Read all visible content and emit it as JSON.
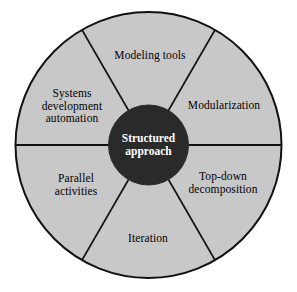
{
  "diagram": {
    "hub": {
      "label": "Structured\napproach",
      "fill": "#2a2a2a",
      "text_color": "#ffffff",
      "radius": 40
    },
    "wheel": {
      "fill": "#c8c8c8",
      "stroke": "#111111",
      "center_x": 148.5,
      "center_y": 145,
      "radius": 133
    },
    "segments": [
      {
        "id": "modeling-tools",
        "label": "Modeling tools",
        "start_angle": -120,
        "end_angle": -60,
        "label_x": 150,
        "label_y": 55
      },
      {
        "id": "modularization",
        "label": "Modularization",
        "start_angle": -60,
        "end_angle": 0,
        "label_x": 224,
        "label_y": 105
      },
      {
        "id": "top-down-decomposition",
        "label": "Top-down\ndecomposition",
        "start_angle": 0,
        "end_angle": 60,
        "label_x": 223,
        "label_y": 183
      },
      {
        "id": "iteration",
        "label": "Iteration",
        "start_angle": 60,
        "end_angle": 120,
        "label_x": 148,
        "label_y": 238
      },
      {
        "id": "parallel-activities",
        "label": "Parallel\nactivities",
        "start_angle": 120,
        "end_angle": 180,
        "label_x": 76,
        "label_y": 185
      },
      {
        "id": "systems-development-automation",
        "label": "Systems\ndevelopment\nautomation",
        "start_angle": 180,
        "end_angle": 240,
        "label_x": 72,
        "label_y": 106
      }
    ]
  }
}
